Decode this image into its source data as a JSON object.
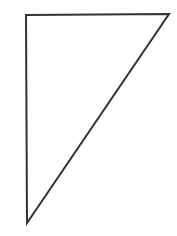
{
  "diagram": {
    "shape": "right-triangle",
    "stroke_color": "#333333",
    "fill_color": "#ffffff",
    "stroke_width": 2,
    "vertices": [
      [
        26,
        15
      ],
      [
        169,
        14
      ],
      [
        27,
        223
      ]
    ]
  }
}
